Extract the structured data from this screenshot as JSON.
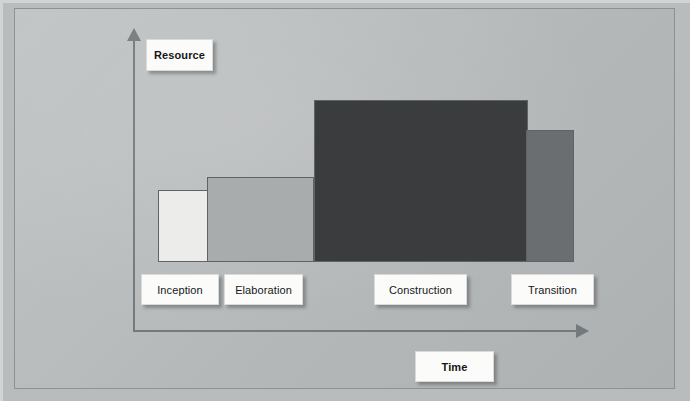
{
  "diagram": {
    "axes": {
      "y_label": "Resource",
      "x_label": "Time"
    },
    "phases": [
      {
        "id": "inception",
        "label": "Inception",
        "color": "#ececea"
      },
      {
        "id": "elaboration",
        "label": "Elaboration",
        "color": "#a9acac"
      },
      {
        "id": "construction",
        "label": "Construction",
        "color": "#3b3c3e"
      },
      {
        "id": "transition",
        "label": "Transition",
        "color": "#6b6e70"
      }
    ]
  },
  "chart_data": {
    "type": "bar",
    "title": "",
    "xlabel": "Time",
    "ylabel": "Resource",
    "categories": [
      "Inception",
      "Elaboration",
      "Construction",
      "Transition"
    ],
    "values": [
      72,
      85,
      162,
      132
    ],
    "value_unit": "relative effort (px height)",
    "series": [
      {
        "name": "Resource effort",
        "values": [
          72,
          85,
          162,
          132
        ]
      }
    ],
    "bar_colors": [
      "#ececea",
      "#a9acac",
      "#3b3c3e",
      "#6b6e70"
    ],
    "bar_widths": [
      51,
      107,
      214,
      48
    ],
    "grid": false,
    "legend": "none",
    "axis_arrows": true,
    "ylim": [
      0,
      200
    ]
  }
}
